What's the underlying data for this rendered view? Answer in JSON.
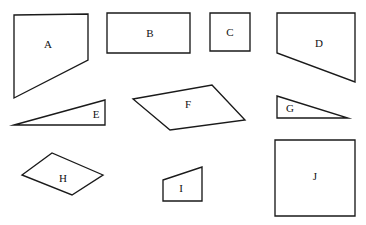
{
  "figure": {
    "type": "shape-identification-diagram",
    "width": 366,
    "height": 225,
    "background_color": "#ffffff",
    "stroke_color": "#1a1a1a",
    "stroke_width": 1.35,
    "label_color": "#111111",
    "label_font_size": 11
  },
  "shapes": [
    {
      "id": "shape-a",
      "label": "A",
      "kind": "quadrilateral",
      "description": "right trapezoid with vertical left side and slanted lower-right edge",
      "sides": 4,
      "points": "14,15 88,14 88,60 14,98",
      "label_x": 48,
      "label_y": 44
    },
    {
      "id": "shape-b",
      "label": "B",
      "kind": "rectangle",
      "description": "wide horizontal rectangle",
      "sides": 4,
      "points": "107,13 190,13 190,53 107,53",
      "label_x": 150,
      "label_y": 33
    },
    {
      "id": "shape-c",
      "label": "C",
      "kind": "square",
      "description": "small square",
      "sides": 4,
      "points": "210,13 250,13 250,51 210,51",
      "label_x": 230,
      "label_y": 32
    },
    {
      "id": "shape-d",
      "label": "D",
      "kind": "quadrilateral",
      "description": "trapezoid with vertical right side and slanted lower-left edge",
      "sides": 4,
      "points": "277,13 355,13 355,82 277,53",
      "label_x": 319,
      "label_y": 43
    },
    {
      "id": "shape-e",
      "label": "E",
      "kind": "triangle",
      "description": "thin right triangle pointing left, horizontal base at bottom",
      "sides": 3,
      "points": "14,125 105,100 105,125",
      "label_x": 96,
      "label_y": 114
    },
    {
      "id": "shape-f",
      "label": "F",
      "kind": "quadrilateral",
      "description": "tilted parallelogram-like quadrilateral",
      "sides": 4,
      "points": "212,85 245,120 170,130 133,99",
      "label_x": 188,
      "label_y": 104
    },
    {
      "id": "shape-g",
      "label": "G",
      "kind": "triangle",
      "description": "right triangle pointing right, vertical left side",
      "sides": 3,
      "points": "277,96 348,118 277,118",
      "label_x": 290,
      "label_y": 108
    },
    {
      "id": "shape-h",
      "label": "H",
      "kind": "quadrilateral",
      "description": "rhombus lying on its side",
      "sides": 4,
      "points": "22,175 52,153 103,175 72,195",
      "label_x": 63,
      "label_y": 178
    },
    {
      "id": "shape-i",
      "label": "I",
      "kind": "quadrilateral",
      "description": "small right trapezoid with slanted top edge",
      "sides": 4,
      "points": "163,180 202,167 202,201 163,201",
      "label_x": 181,
      "label_y": 188
    },
    {
      "id": "shape-j",
      "label": "J",
      "kind": "square",
      "description": "large square",
      "sides": 4,
      "points": "275,140 355,140 355,216 275,216",
      "label_x": 315,
      "label_y": 176
    }
  ]
}
